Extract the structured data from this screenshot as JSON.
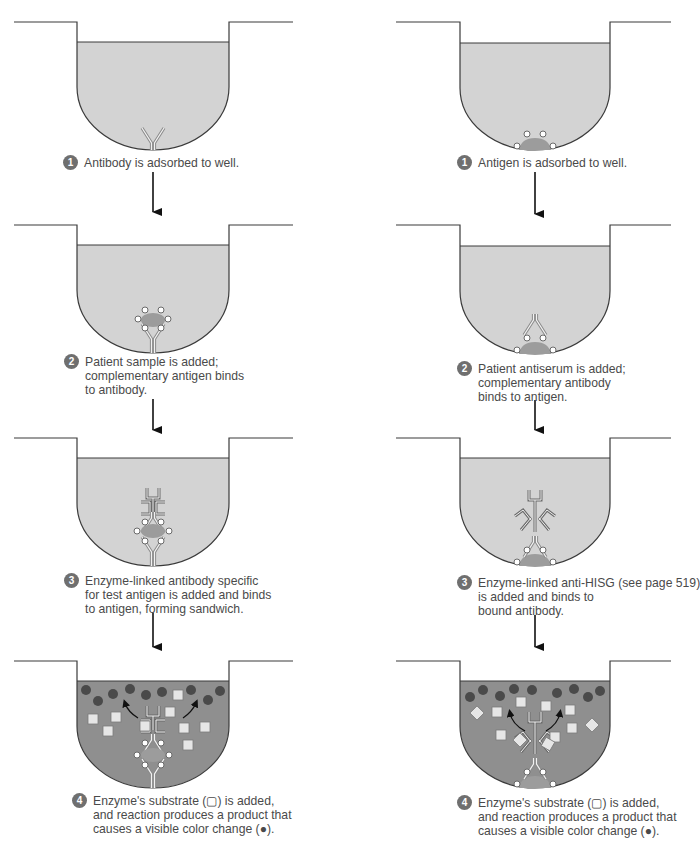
{
  "figure": {
    "colors": {
      "well_outline": "#3a3a3a",
      "liquid_light": "#d3d3d3",
      "liquid_dark": "#8f8f8f",
      "antigen_blob": "#9c9c9c",
      "antigen_site": "#ffffff",
      "antibody": "#8a8a8a",
      "product_dot": "#4a4a4a",
      "substrate_square": "#e6e6e6",
      "step_badge": "#6f6f6f",
      "arrow": "#111111"
    },
    "columns": [
      {
        "name": "direct-elisa-sandwich",
        "steps": [
          {
            "number": "1",
            "lines": [
              "Antibody is adsorbed to well."
            ]
          },
          {
            "number": "2",
            "lines": [
              "Patient sample is added;",
              "complementary antigen binds",
              "to antibody."
            ]
          },
          {
            "number": "3",
            "lines": [
              "Enzyme-linked antibody specific",
              "for test antigen is added and binds",
              "to antigen, forming sandwich."
            ]
          },
          {
            "number": "4",
            "lines": [
              "Enzyme's substrate (▢) is added,",
              "and reaction produces a product that",
              "causes  a visible color change (●)."
            ]
          }
        ]
      },
      {
        "name": "indirect-elisa",
        "steps": [
          {
            "number": "1",
            "lines": [
              "Antigen is adsorbed to well."
            ]
          },
          {
            "number": "2",
            "lines": [
              "Patient antiserum is added;",
              "complementary antibody",
              "binds to antigen."
            ]
          },
          {
            "number": "3",
            "lines": [
              "Enzyme-linked anti-HISG (see page 519)",
              "is added and binds to",
              "bound antibody."
            ]
          },
          {
            "number": "4",
            "lines": [
              "Enzyme's substrate (▢) is added,",
              "and reaction produces a product that",
              "causes a visible color change (●)."
            ]
          }
        ]
      }
    ]
  }
}
